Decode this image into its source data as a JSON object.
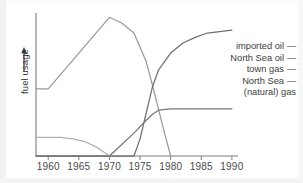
{
  "figure": {
    "y_axis_label": "fuel usage",
    "y_axis_arrow_icon": "up-arrow-icon"
  },
  "legend": {
    "entries": [
      {
        "label": "imported oil",
        "dash": "—",
        "color": "#9a9a9a"
      },
      {
        "label": "North Sea oil",
        "dash": "—",
        "color": "#6f6f6f"
      },
      {
        "label": "town gas",
        "dash": "—",
        "color": "#b0b0b0"
      },
      {
        "label": "North Sea",
        "label2": "(natural) gas",
        "dash": "—",
        "color": "#777777"
      }
    ]
  },
  "chart_data": {
    "type": "line",
    "title": "",
    "xlabel": "",
    "ylabel": "fuel usage",
    "xlim": [
      1958,
      1991
    ],
    "ylim": [
      0,
      100
    ],
    "grid": false,
    "legend_position": "right",
    "xticks": [
      1960,
      1965,
      1970,
      1975,
      1980,
      1985,
      1990
    ],
    "xtick_labels": [
      "1960",
      "1965",
      "1970",
      "1975",
      "1980",
      "1985",
      "1990"
    ],
    "yticks": [],
    "ytick_labels": [],
    "series": [
      {
        "name": "imported oil",
        "color": "#9a9a9a",
        "x": [
          1958,
          1960,
          1970,
          1972,
          1974,
          1976,
          1977,
          1978,
          1979,
          1980
        ],
        "values": [
          47,
          47,
          97,
          93,
          86,
          66,
          50,
          33,
          16,
          0
        ]
      },
      {
        "name": "North Sea oil",
        "color": "#6f6f6f",
        "x": [
          1958,
          1974,
          1975,
          1976,
          1977,
          1978,
          1980,
          1982,
          1984,
          1986,
          1988,
          1990
        ],
        "values": [
          0,
          0,
          12,
          30,
          48,
          60,
          72,
          79,
          83,
          86,
          87,
          88
        ]
      },
      {
        "name": "town gas",
        "color": "#b0b0b0",
        "x": [
          1958,
          1962,
          1964,
          1966,
          1968,
          1969,
          1970
        ],
        "values": [
          13,
          13,
          12,
          10,
          6,
          3,
          0
        ]
      },
      {
        "name": "North Sea (natural) gas",
        "color": "#777777",
        "x": [
          1958,
          1970,
          1972,
          1974,
          1976,
          1977,
          1978,
          1980,
          1985,
          1990
        ],
        "values": [
          0,
          0,
          8,
          16,
          25,
          29,
          32,
          33,
          33,
          33
        ]
      }
    ]
  }
}
